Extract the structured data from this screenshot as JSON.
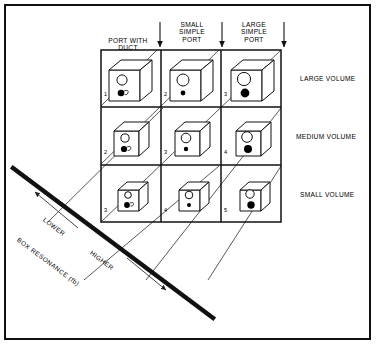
{
  "figure": {
    "border_color": "#111111",
    "line_color": "#1a1a1a",
    "background": "#ffffff"
  },
  "columns": [
    {
      "id": "port-with-duct",
      "label": "PORT WITH\nDUCT",
      "has_duct": true,
      "port_size": "small",
      "dot_size": "small"
    },
    {
      "id": "small-simple-port",
      "label": "SMALL\nSIMPLE\nPORT",
      "has_duct": false,
      "port_size": "medium",
      "dot_size": "tiny"
    },
    {
      "id": "large-simple-port",
      "label": "LARGE\nSIMPLE\nPORT",
      "has_duct": false,
      "port_size": "large",
      "dot_size": "large"
    }
  ],
  "rows": [
    {
      "id": "large-volume",
      "label": "LARGE VOLUME",
      "volume": "large"
    },
    {
      "id": "medium-volume",
      "label": "MEDIUM VOLUME",
      "volume": "medium"
    },
    {
      "id": "small-volume",
      "label": "SMALL VOLUME",
      "volume": "small"
    }
  ],
  "cells": [
    [
      {
        "number": "1"
      },
      {
        "number": "2"
      },
      {
        "number": "3"
      }
    ],
    [
      {
        "number": "2"
      },
      {
        "number": "3"
      },
      {
        "number": "4"
      }
    ],
    [
      {
        "number": "3"
      },
      {
        "number": "4"
      },
      {
        "number": "5"
      }
    ]
  ],
  "axis": {
    "label": "BOX RESONANCE (fb)",
    "low_label": "LOWER",
    "high_label": "HIGHER",
    "low_direction": "up-left",
    "high_direction": "down-right"
  },
  "icons": {
    "column_arrow": "arrow-down-icon",
    "axis_arrow_low": "arrow-up-left-icon",
    "axis_arrow_high": "arrow-down-right-icon"
  }
}
